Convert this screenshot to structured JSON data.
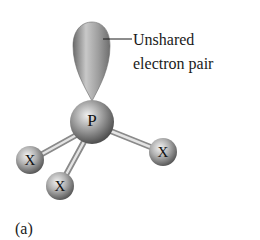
{
  "diagram": {
    "type": "molecular-geometry",
    "central_atom": {
      "symbol": "P",
      "cx": 92,
      "cy": 122,
      "r": 22
    },
    "ligands": [
      {
        "symbol": "X",
        "cx": 30,
        "cy": 160,
        "r": 14
      },
      {
        "symbol": "X",
        "cx": 60,
        "cy": 186,
        "r": 14
      },
      {
        "symbol": "X",
        "cx": 163,
        "cy": 152,
        "r": 14
      }
    ],
    "lone_pair": {
      "label_line1": "Unshared",
      "label_line2": "electron pair"
    },
    "caption": "(a)",
    "colors": {
      "background": "#ffffff",
      "sphere_light": "#e6e6e6",
      "sphere_mid": "#9a9a9a",
      "sphere_dark": "#555555",
      "bond": "#bdbdbd",
      "text": "#1a1a1a"
    }
  }
}
